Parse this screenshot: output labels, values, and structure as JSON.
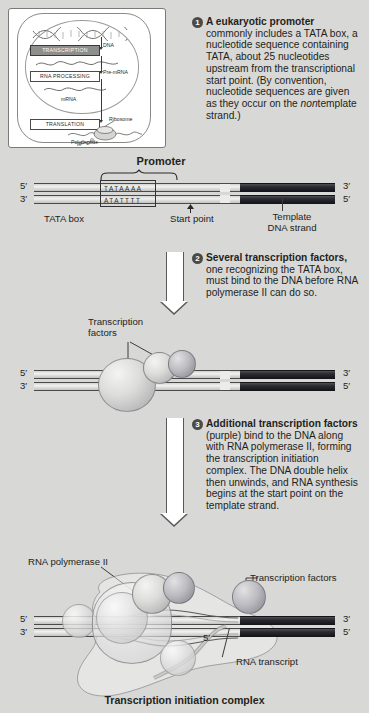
{
  "figure": {
    "caption": "Transcription initiation complex",
    "background_color": "#d8d8d6"
  },
  "inset": {
    "title": "gene-expression-overview",
    "boxes": [
      {
        "label": "TRANSCRIPTION",
        "highlighted": true
      },
      {
        "label": "RNA PROCESSING",
        "highlighted": false
      },
      {
        "label": "TRANSLATION",
        "highlighted": false
      }
    ],
    "labels": [
      "DNA",
      "Pre-mRNA",
      "mRNA",
      "Ribosome",
      "Polypeptide"
    ]
  },
  "steps": [
    {
      "number": "1",
      "bold_lead": "A eukaryotic promoter",
      "body_part1": " commonly includes a TATA box, a nucleotide sequence containing TATA, about 25 nucleotides upstream from the transcriptional start point. (By convention, nucleotide sequences are given as they occur on the ",
      "italic_word": "non",
      "body_part2": "template strand.)"
    },
    {
      "number": "2",
      "bold_lead": "Several transcription factors,",
      "body_part1": " one recognizing the TATA box, must bind to the DNA before RNA polymerase II can do so.",
      "italic_word": "",
      "body_part2": ""
    },
    {
      "number": "3",
      "bold_lead": "Additional transcription factors",
      "body_part1": " (purple) bind to the DNA along with RNA polymerase II, forming the transcription initiation complex. The DNA double helix then unwinds, and RNA synthesis begins at the start point on the template strand.",
      "italic_word": "",
      "body_part2": ""
    }
  ],
  "panel1": {
    "promoter_label": "Promoter",
    "tata_box_label": "TATA box",
    "start_point_label": "Start point",
    "template_label_line1": "Template",
    "template_label_line2": "DNA strand",
    "top_sequence": "TATAAAA",
    "bottom_sequence": "ATATTTT",
    "five_prime_top": "5′",
    "three_prime_top": "3′",
    "three_prime_left_bottom": "3′",
    "five_prime_right_bottom": "5′"
  },
  "panel2": {
    "tf_label_line1": "Transcription",
    "tf_label_line2": "factors",
    "five_prime_top": "5′",
    "three_prime_top": "3′",
    "three_prime_left_bottom": "3′",
    "five_prime_right_bottom": "5′"
  },
  "panel3": {
    "polymerase_label": "RNA polymerase II",
    "tf_label": "Transcription factors",
    "rna_transcript_label": "RNA transcript",
    "rna_five_prime": "5′",
    "five_prime_top": "5′",
    "three_prime_top": "3′",
    "three_prime_left_bottom": "3′",
    "five_prime_right_bottom": "5′"
  },
  "colors": {
    "background": "#d8d8d6",
    "dna_light": "#e4e4e2",
    "dna_template_dark": "#26262c",
    "text": "#231f20",
    "step_badge": "#4a4a48"
  }
}
